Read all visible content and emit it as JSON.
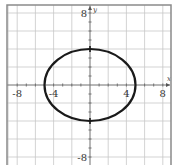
{
  "chart_data": {
    "type": "line",
    "title": "",
    "xlabel": "x",
    "ylabel": "y",
    "xlim": [
      -9,
      9
    ],
    "ylim": [
      -9,
      8.5
    ],
    "grid": true,
    "grid_step": 2,
    "x_tick_labels": [
      {
        "value": -8,
        "text": "-8"
      },
      {
        "value": -4,
        "text": "-4"
      },
      {
        "value": 4,
        "text": "4"
      },
      {
        "value": 8,
        "text": "8"
      }
    ],
    "y_tick_labels": [
      {
        "value": 8,
        "text": "8"
      },
      {
        "value": -8,
        "text": "-8"
      }
    ],
    "series": [
      {
        "name": "ellipse",
        "equation": "x^2/25 + y^2/16 = 1",
        "center": [
          0,
          0
        ],
        "semi_axis_x": 5,
        "semi_axis_y": 4,
        "color": "#1a1a1a"
      }
    ],
    "marked_points": [
      {
        "x": 0,
        "y": 4
      },
      {
        "x": 0,
        "y": -4
      }
    ]
  }
}
